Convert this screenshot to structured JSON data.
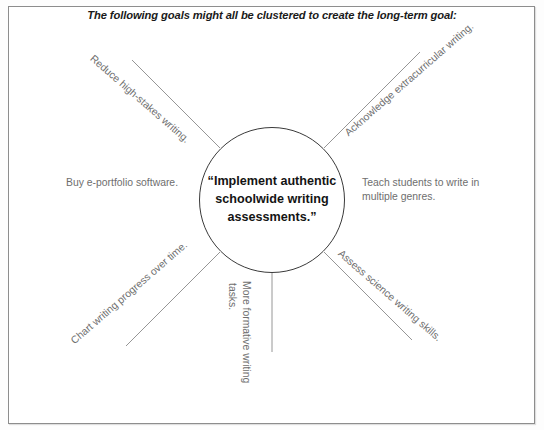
{
  "page": {
    "title": "The following goals might all be clustered to create the long-term goal:",
    "frame_border_color": "#8d8d8d",
    "label_color": "#6e6e6e",
    "circle_border_color": "#3a3a3a",
    "circle_text_color": "#141414"
  },
  "center": {
    "lines": [
      "“Implement authentic",
      "schoolwide writing",
      "assessments.”"
    ],
    "full_text": "“Implement authentic schoolwide writing assessments.”"
  },
  "spokes": [
    {
      "id": "nw",
      "text": "Reduce high-stakes writing.",
      "position": "upper-left",
      "rotation_deg": 41
    },
    {
      "id": "ne",
      "text": "Acknowledge extracurricular writing.",
      "position": "upper-right",
      "rotation_deg": -41
    },
    {
      "id": "w",
      "text": "Buy e-portfolio software.",
      "position": "left",
      "rotation_deg": 0
    },
    {
      "id": "e",
      "text": "Teach students to write in multiple genres.",
      "line1": "Teach students to write in",
      "line2": "multiple genres.",
      "position": "right",
      "rotation_deg": 0
    },
    {
      "id": "se",
      "text": "Assess science writing skills.",
      "position": "lower-right",
      "rotation_deg": 41
    },
    {
      "id": "s",
      "text": "More formative writing tasks.",
      "col1": "More formative writing",
      "col2": "tasks.",
      "position": "bottom",
      "rotation_deg": 90
    },
    {
      "id": "sw",
      "text": "Chart writing progress over time.",
      "position": "lower-left",
      "rotation_deg": -41
    }
  ]
}
